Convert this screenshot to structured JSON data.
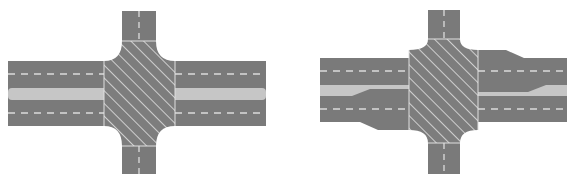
{
  "canvas": {
    "width": 573,
    "height": 180,
    "background": "#ffffff"
  },
  "colors": {
    "asphalt": "#7a7a7a",
    "median": "#c6c6c6",
    "lane_marking": "#dcdcdc",
    "hatch_fill": "#7d7d7d",
    "hatch_line": "#cfcfcf",
    "edge_line": "#e0e0e0"
  },
  "figures": [
    {
      "id": "standard-intersection",
      "type": "four-way-intersection",
      "main_road": {
        "x1": 8,
        "x2": 266,
        "y_top": 61,
        "y_bottom": 126
      },
      "median": {
        "y_top": 88,
        "y_bottom": 100
      },
      "lane_lines_y": [
        74,
        113
      ],
      "cross_road": {
        "x_left": 122,
        "x_right": 156,
        "y_top": 11,
        "y_bottom": 174
      },
      "box": {
        "x_left": 104,
        "x_right": 175,
        "y_top": 41,
        "y_bottom": 146
      },
      "flared": false
    },
    {
      "id": "flared-intersection",
      "type": "four-way-intersection-with-flared-approaches",
      "main_road": {
        "x1": 320,
        "x2": 567,
        "y_top": 58,
        "y_bottom": 122
      },
      "median": {
        "y_top": 85,
        "y_bottom": 96
      },
      "lane_lines_y": [
        71,
        109
      ],
      "cross_road": {
        "x_left": 428,
        "x_right": 460,
        "y_top": 10,
        "y_bottom": 174
      },
      "box": {
        "x_left": 409,
        "x_right": 478,
        "y_top": 39,
        "y_bottom": 143
      },
      "flared": true
    }
  ]
}
